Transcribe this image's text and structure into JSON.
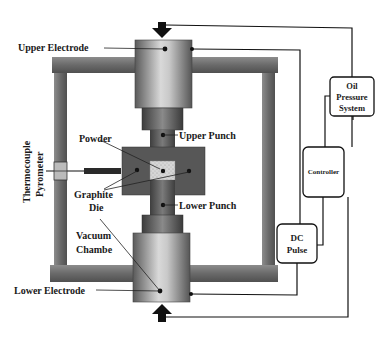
{
  "diagram": {
    "type": "spark-plasma-sintering-schematic",
    "labels": {
      "upper_electrode": "Upper Electrode",
      "lower_electrode": "Lower Electrode",
      "upper_punch": "Upper Punch",
      "lower_punch": "Lower Punch",
      "powder": "Powder",
      "graphite_die_line1": "Graphite",
      "graphite_die_line2": "Die",
      "vacuum_chamber_line1": "Vacuum",
      "vacuum_chamber_line2": "Chambe",
      "thermocouple_line1": "Thermocouple",
      "thermocouple_line2": "Pyrometer"
    },
    "boxes": {
      "oil_pressure": {
        "line1": "Oil",
        "line2": "Pressure",
        "line3": "System"
      },
      "controller": {
        "label": "Controller"
      },
      "dc_pulse": {
        "line1": "DC",
        "line2": "Pulse"
      }
    },
    "icons": {
      "top_arrow": "arrow-down-icon",
      "bottom_arrow": "arrow-up-icon"
    },
    "colors": {
      "frame": "#6e6e6e",
      "electrode_light": "#d4d4d4",
      "electrode_dark": "#5a5a5a",
      "die": "#555555",
      "powder": "#d8d8d8",
      "line": "#111111"
    }
  }
}
